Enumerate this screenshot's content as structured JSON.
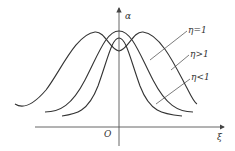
{
  "diagram": {
    "axes": {
      "y_label": "α",
      "x_label": "ξ",
      "origin_label": "O"
    },
    "curves": [
      {
        "label": "η=1",
        "shape": "single peak, medium width"
      },
      {
        "label": "η>1",
        "shape": "double peak, widest"
      },
      {
        "label": "η<1",
        "shape": "single peak, narrowest, lower"
      }
    ],
    "colors": {
      "line": "#333333",
      "axis": "#555555"
    }
  }
}
